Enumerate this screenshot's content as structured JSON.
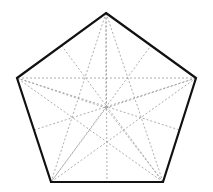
{
  "figure": {
    "canvas": {
      "width": 213,
      "height": 192,
      "background": "#ffffff"
    },
    "styles": {
      "outline_color": "#111111",
      "outline_width": 2.2,
      "dashed_color": "#999999",
      "dashed_width": 0.8,
      "dash_pattern": "2,2"
    },
    "center": {
      "label": "O",
      "x": 106,
      "y": 108
    },
    "vertices": [
      {
        "label": "A",
        "x": 106,
        "y": 13,
        "position": "top"
      },
      {
        "label": "B",
        "x": 196,
        "y": 78,
        "position": "right"
      },
      {
        "label": "C",
        "x": 163,
        "y": 182,
        "position": "bottom-right"
      },
      {
        "label": "D",
        "x": 51,
        "y": 182,
        "position": "bottom-left"
      },
      {
        "label": "E",
        "x": 17,
        "y": 78,
        "position": "left"
      }
    ],
    "edge_midpoints": [
      {
        "label": "M_AB",
        "x": 151,
        "y": 45.5,
        "edge": "A-B"
      },
      {
        "label": "M_BC",
        "x": 179.5,
        "y": 130,
        "edge": "B-C"
      },
      {
        "label": "M_CD",
        "x": 107,
        "y": 182,
        "edge": "C-D"
      },
      {
        "label": "M_DE",
        "x": 34,
        "y": 130,
        "edge": "D-E"
      },
      {
        "label": "M_EA",
        "x": 61.5,
        "y": 45.5,
        "edge": "E-A"
      }
    ],
    "outline_edges": [
      {
        "from": "A",
        "to": "B"
      },
      {
        "from": "B",
        "to": "C"
      },
      {
        "from": "C",
        "to": "D"
      },
      {
        "from": "D",
        "to": "E"
      },
      {
        "from": "E",
        "to": "A"
      }
    ],
    "diagonals": [
      {
        "from": "A",
        "to": "C",
        "style": "dashed"
      },
      {
        "from": "A",
        "to": "D",
        "style": "dashed"
      },
      {
        "from": "B",
        "to": "D",
        "style": "dashed"
      },
      {
        "from": "B",
        "to": "E",
        "style": "dashed"
      },
      {
        "from": "C",
        "to": "E",
        "style": "dashed"
      }
    ],
    "symmetry_axes": [
      {
        "from": "A",
        "to": "M_CD",
        "style": "dashed"
      },
      {
        "from": "B",
        "to": "M_DE",
        "style": "dashed"
      },
      {
        "from": "C",
        "to": "M_EA",
        "style": "dashed"
      },
      {
        "from": "D",
        "to": "M_AB",
        "style": "dashed"
      },
      {
        "from": "E",
        "to": "M_BC",
        "style": "dashed"
      }
    ],
    "center_spokes": [
      {
        "from": "O",
        "to": "A",
        "style": "dashed"
      },
      {
        "from": "O",
        "to": "B",
        "style": "dashed"
      },
      {
        "from": "O",
        "to": "C",
        "style": "dashed"
      },
      {
        "from": "O",
        "to": "D",
        "style": "dashed"
      },
      {
        "from": "O",
        "to": "E",
        "style": "dashed"
      }
    ]
  }
}
